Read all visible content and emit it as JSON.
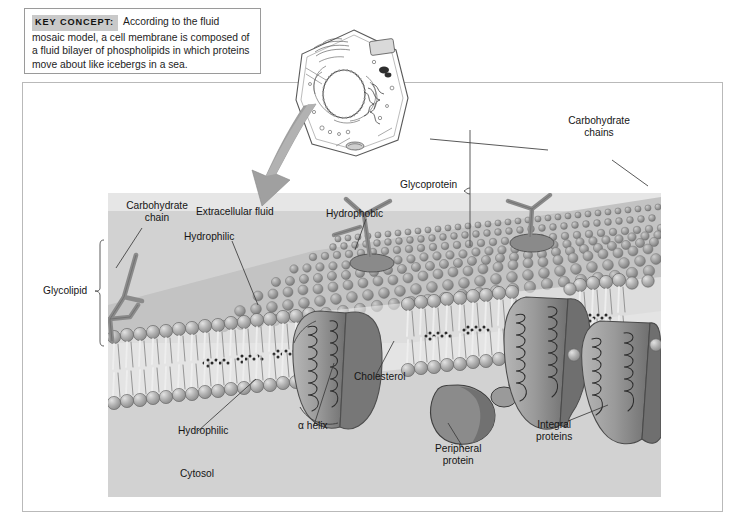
{
  "figure": {
    "key_concept": {
      "tag": "KEY CONCEPT:",
      "text": "According to the fluid mosaic model, a cell membrane is composed of a fluid bilayer of phospholipids in which proteins move about like icebergs in a sea."
    },
    "inset": {
      "name": "animal-cell-illustration"
    },
    "arrow": {
      "name": "zoom-arrow",
      "direction": "down-left"
    },
    "labels": {
      "carbohydrate_chain": "Carbohydrate\nchain",
      "carbohydrate_chains": "Carbohydrate\nchains",
      "glycolipid": "Glycolipid",
      "glycoprotein": "Glycoprotein",
      "extracellular_fluid": "Extracellular fluid",
      "hydrophilic_top": "Hydrophilic",
      "hydrophobic": "Hydrophobic",
      "hydrophilic_bottom": "Hydrophilic",
      "alpha_helix": "α helix",
      "cholesterol": "Cholesterol",
      "peripheral_protein": "Peripheral\nprotein",
      "integral_proteins": "Integral\nproteins",
      "cytosol": "Cytosol"
    },
    "colors": {
      "panel_background": "#d2d2d2",
      "extracellular_band": "#e6e6e6",
      "protein_fill": "#8e8e8e",
      "protein_dark": "#6e6e6e",
      "lipid_head": "#a8a8a8",
      "carbohydrate": "#8a8a8a",
      "arrow": "#9a9a9a",
      "keytag_background": "#c9c9c9",
      "leader_line": "#3b3b3b"
    }
  }
}
